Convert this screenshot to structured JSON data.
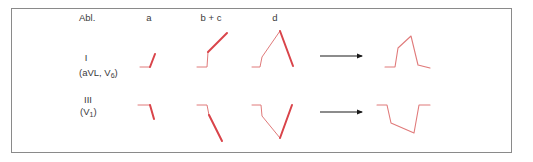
{
  "header": {
    "lead_label": "Abl.",
    "columns": [
      "a",
      "b + c",
      "d"
    ]
  },
  "rows": [
    {
      "lead": "I",
      "sub_leads_prefix": "(aVL, V",
      "sub_leads_sub": "6",
      "sub_leads_suffix": ")"
    },
    {
      "lead": "III",
      "sub_leads_prefix": "(V",
      "sub_leads_sub": "1",
      "sub_leads_suffix": ")"
    }
  ],
  "colors": {
    "trace": "#d9444a",
    "trace_thin": "#e07a7a",
    "arrow": "#1a1a1a",
    "border": "#8a8a8a",
    "text": "#3a3a3a"
  },
  "traces": {
    "row1": {
      "a": {
        "thin": "140,67 150,67",
        "thick": "150,67 155,54"
      },
      "bc": {
        "thin": "197,67 207,67 208,52",
        "thick": "208,52 227,33"
      },
      "d": {
        "thin": "252,67 260,67 262,57 280,31",
        "thick": "280,31 293,66"
      },
      "result": "385,67 395,67 398,48 411,36 418,65 430,68"
    },
    "row2": {
      "a": {
        "thin": "138,105 150,105",
        "thick": "150,105 154,119"
      },
      "bc": {
        "thin": "197,105 207,105 209,115",
        "thick": "209,115 222,141"
      },
      "d": {
        "thin": "252,105 261,105 262,116 280,138",
        "thick": "280,138 292,105"
      },
      "result": "377,105 387,105 391,123 414,133 419,105 430,105"
    }
  }
}
